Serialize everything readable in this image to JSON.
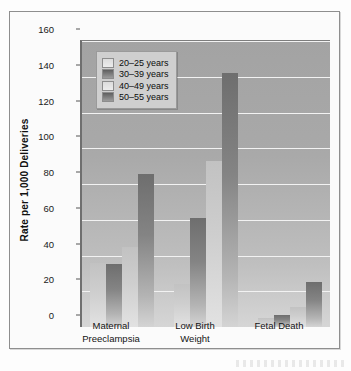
{
  "chart_data": {
    "type": "bar",
    "title": "",
    "xlabel": "",
    "ylabel": "Rate per 1,000 Deliveries",
    "ylim": [
      0,
      160
    ],
    "ytick_step": 20,
    "yticks": [
      160,
      140,
      120,
      100,
      80,
      60,
      40,
      20,
      0
    ],
    "grid": true,
    "legend_position": "top-left-inside",
    "categories": [
      "Maternal Preeclampsia",
      "Low Birth Weight",
      "Fetal Death"
    ],
    "category_lines": [
      [
        "Maternal",
        "Preeclampsia"
      ],
      [
        "Low Birth",
        "Weight"
      ],
      [
        "Fetal Death",
        ""
      ]
    ],
    "series": [
      {
        "name": "20–25 years",
        "shade": "light",
        "values": [
          36,
          24,
          5
        ]
      },
      {
        "name": "30–39 years",
        "shade": "dark",
        "values": [
          35,
          61,
          6.5
        ]
      },
      {
        "name": "40–49 years",
        "shade": "light",
        "values": [
          45,
          93,
          11
        ]
      },
      {
        "name": "50–55 years",
        "shade": "dark",
        "values": [
          85.5,
          142,
          25
        ]
      }
    ]
  },
  "colors": {
    "plot_background": "#a9a9a9",
    "gridline": "#f2f2f2",
    "bar_light": "#cecece",
    "bar_dark": "#848484",
    "legend_background": "#cfcfcf",
    "axis": "#6f6f6f",
    "text": "#111111"
  }
}
